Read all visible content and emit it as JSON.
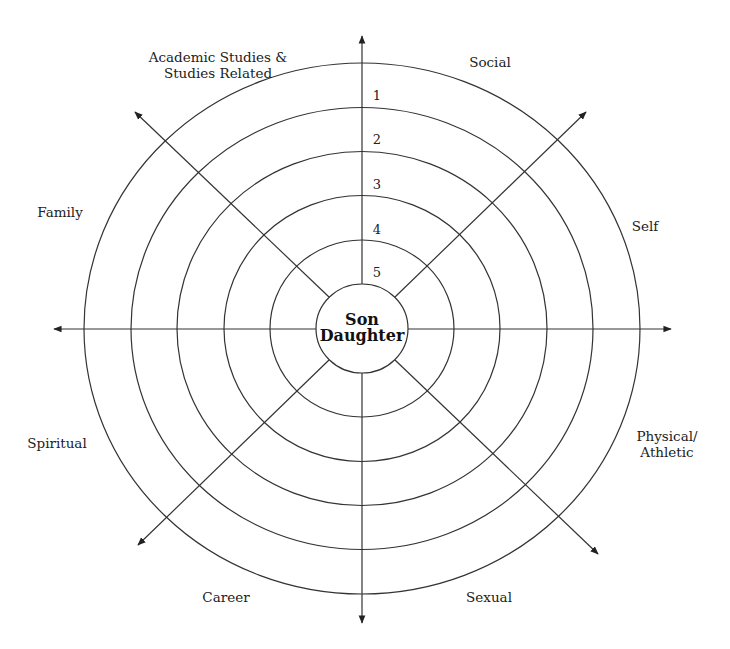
{
  "diagram": {
    "center_label": {
      "line1": "Son",
      "line2": "Daughter"
    },
    "ring_numbers": [
      "1",
      "2",
      "3",
      "4",
      "5"
    ],
    "categories": [
      {
        "id": "academic",
        "line1": "Academic Studies &",
        "line2": "Studies Related",
        "x": 218,
        "y": 65
      },
      {
        "id": "social",
        "line1": "Social",
        "line2": "",
        "x": 490,
        "y": 62
      },
      {
        "id": "family",
        "line1": "Family",
        "line2": "",
        "x": 60,
        "y": 212
      },
      {
        "id": "self",
        "line1": "Self",
        "line2": "",
        "x": 645,
        "y": 226
      },
      {
        "id": "spiritual",
        "line1": "Spiritual",
        "line2": "",
        "x": 57,
        "y": 443
      },
      {
        "id": "physical",
        "line1": "Physical/",
        "line2": "Athletic",
        "x": 667,
        "y": 444
      },
      {
        "id": "career",
        "line1": "Career",
        "line2": "",
        "x": 226,
        "y": 597
      },
      {
        "id": "sexual",
        "line1": "Sexual",
        "line2": "",
        "x": 489,
        "y": 597
      }
    ],
    "colors": {
      "line": "#333333",
      "text": "#222222"
    }
  }
}
